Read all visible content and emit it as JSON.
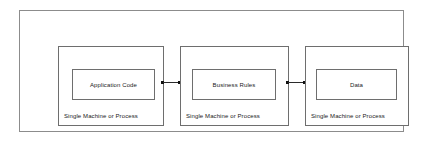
{
  "diagram": {
    "type": "architecture-tier-diagram",
    "background_color": "#ffffff",
    "border_color": "#8c8c8c",
    "box_border_color": "#6e6e6e",
    "connector_color": "#2b2b2b",
    "text_color": "#1a1a1a",
    "tiers": [
      {
        "id": "application-code",
        "component_label": "Application Code",
        "caption": "Single Machine or Process"
      },
      {
        "id": "business-rules",
        "component_label": "Business Rules",
        "caption": "Single Machine or Process"
      },
      {
        "id": "data",
        "component_label": "Data",
        "caption": "Single Machine or Process"
      }
    ],
    "connectors": [
      {
        "id": "connector-app-to-rules",
        "from": "application-code",
        "to": "business-rules",
        "endpoint_style": "dot"
      },
      {
        "id": "connector-rules-to-data",
        "from": "business-rules",
        "to": "data",
        "endpoint_style": "dot"
      }
    ]
  }
}
